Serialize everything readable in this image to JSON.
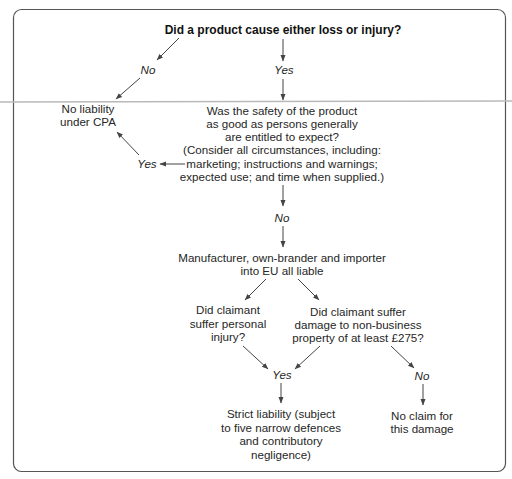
{
  "diagram": {
    "title": "Did a product cause either loss or injury?",
    "branch_top_no": "No",
    "branch_top_yes": "Yes",
    "no_liability": [
      "No liability",
      "under CPA"
    ],
    "safety_question": [
      "Was the safety of the product",
      "as good as persons generally",
      "are entitled to expect?",
      "(Consider all circumstances, including:",
      "marketing; instructions and warnings;",
      "expected use; and time when supplied.)"
    ],
    "safety_yes": "Yes",
    "safety_no": "No",
    "liable_parties": [
      "Manufacturer, own-brander and importer",
      "into EU all liable"
    ],
    "personal_injury_question": [
      "Did claimant",
      "suffer personal",
      "injury?"
    ],
    "property_question": [
      "Did claimant suffer",
      "damage to non-business",
      "property of at least £275?"
    ],
    "claim_yes": "Yes",
    "claim_no": "No",
    "strict_liability": [
      "Strict liability (subject",
      "to five narrow defences",
      "and contributory",
      "negligence)"
    ],
    "no_claim": [
      "No claim for",
      "this damage"
    ],
    "colors": {
      "text": "#262626",
      "frame": "#555555",
      "arrow": "#444444",
      "background": "#ffffff"
    }
  }
}
